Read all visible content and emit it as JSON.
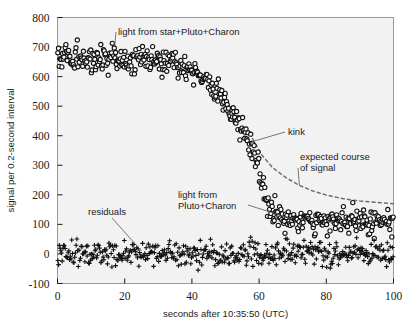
{
  "figure": {
    "background_color": "#ffffff",
    "plot_background_color": "#f2f2f2",
    "frame_color": "#9a9a9a",
    "marker_color": "#111111",
    "expected_curve_color": "#6f6f6f"
  },
  "chart_data": {
    "type": "scatter",
    "title": "",
    "xlabel": "seconds after 10:35:50 (UTC)",
    "ylabel": "signal per 0.2-second interval",
    "xlim": [
      0,
      100
    ],
    "ylim": [
      -100,
      800
    ],
    "xticks": [
      0,
      20,
      40,
      60,
      80,
      100
    ],
    "yticks": [
      -100,
      0,
      100,
      200,
      300,
      400,
      500,
      600,
      700,
      800
    ],
    "xticklabels": [
      "0",
      "20",
      "40",
      "60",
      "80",
      "100"
    ],
    "yticklabels": [
      "-100",
      "0",
      "100",
      "200",
      "300",
      "400",
      "500",
      "600",
      "700",
      "800"
    ],
    "grid": false,
    "legend": "none",
    "series": [
      {
        "name": "light from star+Pluto+Charon",
        "marker": "open-circle",
        "description": "Stellar occultation light curve: flat plateau near 660 counts until t~38 s, smooth decline through the ingress, steepening at the kink near t~58 s, then a low plateau near 115 counts after t~65 s.",
        "profile": [
          {
            "x": 0,
            "y": 660
          },
          {
            "x": 5,
            "y": 662
          },
          {
            "x": 10,
            "y": 658
          },
          {
            "x": 15,
            "y": 663
          },
          {
            "x": 20,
            "y": 655
          },
          {
            "x": 25,
            "y": 660
          },
          {
            "x": 30,
            "y": 652
          },
          {
            "x": 35,
            "y": 645
          },
          {
            "x": 38,
            "y": 638
          },
          {
            "x": 41,
            "y": 620
          },
          {
            "x": 44,
            "y": 592
          },
          {
            "x": 47,
            "y": 553
          },
          {
            "x": 50,
            "y": 505
          },
          {
            "x": 52,
            "y": 468
          },
          {
            "x": 54,
            "y": 432
          },
          {
            "x": 56,
            "y": 400
          },
          {
            "x": 58,
            "y": 378
          },
          {
            "x": 59,
            "y": 340
          },
          {
            "x": 60,
            "y": 288
          },
          {
            "x": 61,
            "y": 235
          },
          {
            "x": 62,
            "y": 190
          },
          {
            "x": 63,
            "y": 158
          },
          {
            "x": 64,
            "y": 138
          },
          {
            "x": 66,
            "y": 125
          },
          {
            "x": 70,
            "y": 118
          },
          {
            "x": 75,
            "y": 115
          },
          {
            "x": 80,
            "y": 113
          },
          {
            "x": 85,
            "y": 112
          },
          {
            "x": 90,
            "y": 112
          },
          {
            "x": 95,
            "y": 113
          },
          {
            "x": 100,
            "y": 114
          }
        ],
        "scatter_sigma": 22,
        "n_points": 500
      },
      {
        "name": "residuals",
        "marker": "plus",
        "description": "Fit residuals scattered about zero across the full time range.",
        "profile": [
          {
            "x": 0,
            "y": 0
          },
          {
            "x": 20,
            "y": 0
          },
          {
            "x": 40,
            "y": 0
          },
          {
            "x": 60,
            "y": 0
          },
          {
            "x": 80,
            "y": 0
          },
          {
            "x": 100,
            "y": 0
          }
        ],
        "scatter_sigma": 20,
        "n_points": 460
      },
      {
        "name": "expected course of signal",
        "marker": "dashed-line",
        "description": "Dashed model curve of the signal expected without the kink, falling from the kink point and flattening near 170 counts at the right edge.",
        "profile": [
          {
            "x": 58,
            "y": 390
          },
          {
            "x": 61,
            "y": 332
          },
          {
            "x": 64,
            "y": 292
          },
          {
            "x": 68,
            "y": 258
          },
          {
            "x": 72,
            "y": 232
          },
          {
            "x": 76,
            "y": 213
          },
          {
            "x": 80,
            "y": 199
          },
          {
            "x": 85,
            "y": 187
          },
          {
            "x": 90,
            "y": 179
          },
          {
            "x": 95,
            "y": 174
          },
          {
            "x": 100,
            "y": 170
          }
        ]
      }
    ],
    "annotations": [
      {
        "id": "star-pluto-charon",
        "text": "light from star+Pluto+Charon",
        "points_to": {
          "x": 17,
          "y": 700
        }
      },
      {
        "id": "kink",
        "text": "kink",
        "points_to": {
          "x": 58,
          "y": 380
        }
      },
      {
        "id": "expected-course",
        "text_line1": "expected course",
        "text_line2": "of signal",
        "points_to": {
          "x": 72,
          "y": 232
        }
      },
      {
        "id": "pluto-charon",
        "text_line1": "light from",
        "text_line2": "Pluto+Charon",
        "points_to": {
          "x": 70,
          "y": 118
        }
      },
      {
        "id": "residuals",
        "text": "residuals",
        "points_to": {
          "x": 25,
          "y": 10
        }
      }
    ]
  }
}
